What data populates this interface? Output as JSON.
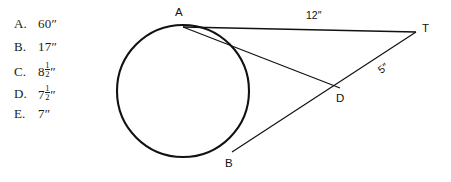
{
  "question": {
    "choices": [
      {
        "key": "A.",
        "value": "60″",
        "whole": "60",
        "fraction": null,
        "unit": "″"
      },
      {
        "key": "B.",
        "value": "17″",
        "whole": "17",
        "fraction": null,
        "unit": "″"
      },
      {
        "key": "C.",
        "value": "8½″",
        "whole": "8",
        "fraction": {
          "num": "1",
          "den": "2"
        },
        "unit": "″"
      },
      {
        "key": "D.",
        "value": "7½″",
        "whole": "7",
        "fraction": {
          "num": "1",
          "den": "2"
        },
        "unit": "″"
      },
      {
        "key": "E.",
        "value": "7″",
        "whole": "7",
        "fraction": null,
        "unit": "″"
      }
    ]
  },
  "figure": {
    "points": {
      "A": {
        "label": "A",
        "x": 183,
        "y": 27
      },
      "B": {
        "label": "B",
        "x": 232,
        "y": 152
      },
      "D": {
        "label": "D",
        "x": 340,
        "y": 88
      },
      "T": {
        "label": "T",
        "x": 416,
        "y": 32
      }
    },
    "circle": {
      "cx": 183,
      "cy": 91,
      "r": 66
    },
    "segments": [
      {
        "name": "tangent-a-t",
        "from": "A",
        "to": "T",
        "measure": "12″"
      },
      {
        "name": "chord-a-d",
        "from": "A",
        "to": "D",
        "measure": null
      },
      {
        "name": "secant-b-t",
        "from": "B",
        "to": "T",
        "measure": null
      }
    ],
    "measures": {
      "tangent": "12″",
      "external_secant": "5″"
    },
    "colors": {
      "stroke": "#111111",
      "background": "#ffffff"
    }
  }
}
